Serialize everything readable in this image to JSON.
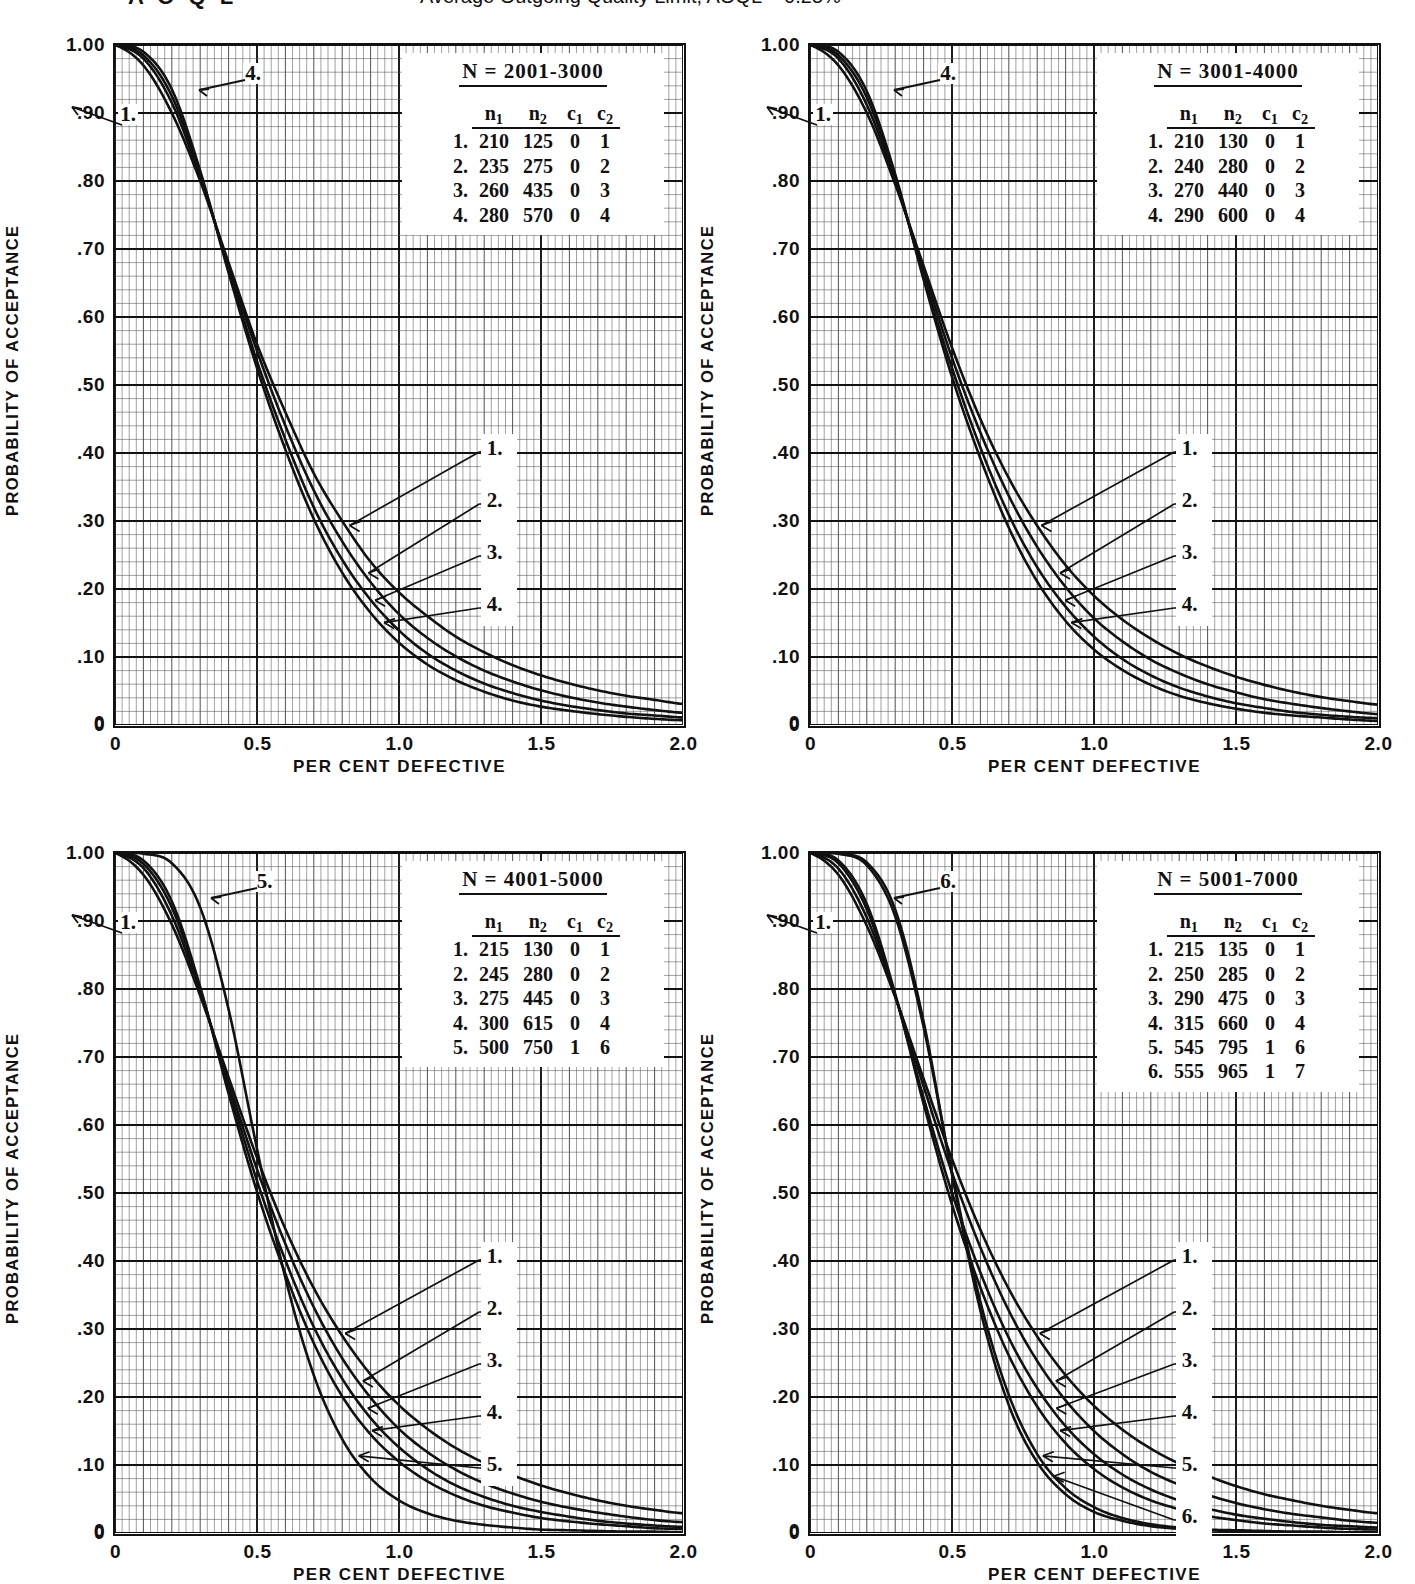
{
  "header": {
    "left_label": "A O Q L",
    "caption": "Average Outgoing Quality Limit, AOQL = 0.25%"
  },
  "axes": {
    "ylabel": "PROBABILITY OF ACCEPTANCE",
    "xlabel": "PER CENT DEFECTIVE",
    "yticks": [
      "1.00",
      ".90",
      ".80",
      ".70",
      ".60",
      ".50",
      ".40",
      ".30",
      ".20",
      ".10",
      "0"
    ],
    "xticks": [
      "0",
      "0.5",
      "1.0",
      "1.5",
      "2.0"
    ],
    "zero_corner": "0"
  },
  "legend_headers": {
    "n1": "n",
    "n1_sub": "1",
    "n2": "n",
    "n2_sub": "2",
    "c1": "c",
    "c1_sub": "1",
    "c2": "c",
    "c2_sub": "2"
  },
  "charts": [
    {
      "id": "chart-n-2001-3000",
      "legend_title": "N = 2001-3000",
      "rows": [
        {
          "idx": "1.",
          "n1": "210",
          "n2": "125",
          "c1": "0",
          "c2": "1"
        },
        {
          "idx": "2.",
          "n1": "235",
          "n2": "275",
          "c1": "0",
          "c2": "2"
        },
        {
          "idx": "3.",
          "n1": "260",
          "n2": "435",
          "c1": "0",
          "c2": "3"
        },
        {
          "idx": "4.",
          "n1": "280",
          "n2": "570",
          "c1": "0",
          "c2": "4"
        }
      ],
      "top_labels": [
        {
          "text": "4.",
          "x": 0.225,
          "y": 0.955
        },
        {
          "text": "1.",
          "x": 0.005,
          "y": 0.895
        }
      ],
      "right_labels": [
        "1.",
        "2.",
        "3.",
        "4."
      ]
    },
    {
      "id": "chart-n-3001-4000",
      "legend_title": "N = 3001-4000",
      "rows": [
        {
          "idx": "1.",
          "n1": "210",
          "n2": "130",
          "c1": "0",
          "c2": "1"
        },
        {
          "idx": "2.",
          "n1": "240",
          "n2": "280",
          "c1": "0",
          "c2": "2"
        },
        {
          "idx": "3.",
          "n1": "270",
          "n2": "440",
          "c1": "0",
          "c2": "3"
        },
        {
          "idx": "4.",
          "n1": "290",
          "n2": "600",
          "c1": "0",
          "c2": "4"
        }
      ],
      "top_labels": [
        {
          "text": "4.",
          "x": 0.225,
          "y": 0.955
        },
        {
          "text": "1.",
          "x": 0.005,
          "y": 0.895
        }
      ],
      "right_labels": [
        "1.",
        "2.",
        "3.",
        "4."
      ]
    },
    {
      "id": "chart-n-4001-5000",
      "legend_title": "N = 4001-5000",
      "rows": [
        {
          "idx": "1.",
          "n1": "215",
          "n2": "130",
          "c1": "0",
          "c2": "1"
        },
        {
          "idx": "2.",
          "n1": "245",
          "n2": "280",
          "c1": "0",
          "c2": "2"
        },
        {
          "idx": "3.",
          "n1": "275",
          "n2": "445",
          "c1": "0",
          "c2": "3"
        },
        {
          "idx": "4.",
          "n1": "300",
          "n2": "615",
          "c1": "0",
          "c2": "4"
        },
        {
          "idx": "5.",
          "n1": "500",
          "n2": "750",
          "c1": "1",
          "c2": "6"
        }
      ],
      "top_labels": [
        {
          "text": "5.",
          "x": 0.245,
          "y": 0.955
        },
        {
          "text": "1.",
          "x": 0.005,
          "y": 0.895
        }
      ],
      "right_labels": [
        "1.",
        "2.",
        "3.",
        "4.",
        "5."
      ]
    },
    {
      "id": "chart-n-5001-7000",
      "legend_title": "N = 5001-7000",
      "rows": [
        {
          "idx": "1.",
          "n1": "215",
          "n2": "135",
          "c1": "0",
          "c2": "1"
        },
        {
          "idx": "2.",
          "n1": "250",
          "n2": "285",
          "c1": "0",
          "c2": "2"
        },
        {
          "idx": "3.",
          "n1": "290",
          "n2": "475",
          "c1": "0",
          "c2": "3"
        },
        {
          "idx": "4.",
          "n1": "315",
          "n2": "660",
          "c1": "0",
          "c2": "4"
        },
        {
          "idx": "5.",
          "n1": "545",
          "n2": "795",
          "c1": "1",
          "c2": "6"
        },
        {
          "idx": "6.",
          "n1": "555",
          "n2": "965",
          "c1": "1",
          "c2": "7"
        }
      ],
      "top_labels": [
        {
          "text": "6.",
          "x": 0.225,
          "y": 0.955
        },
        {
          "text": "1.",
          "x": 0.005,
          "y": 0.895
        }
      ],
      "right_labels": [
        "1.",
        "2.",
        "3.",
        "4.",
        "5.",
        "6."
      ]
    }
  ],
  "chart_data": {
    "type": "line",
    "xlabel": "PER CENT DEFECTIVE",
    "ylabel": "PROBABILITY OF ACCEPTANCE",
    "xlim": [
      0,
      2.0
    ],
    "ylim": [
      0,
      1.0
    ],
    "xticks": [
      0,
      0.5,
      1.0,
      1.5,
      2.0
    ],
    "yticks": [
      0,
      0.1,
      0.2,
      0.3,
      0.4,
      0.5,
      0.6,
      0.7,
      0.8,
      0.9,
      1.0
    ],
    "grid": "major and minor rectangular grid",
    "legend_position": "upper-right inset box",
    "panels": [
      {
        "panel_title": "N = 2001-3000",
        "x": [
          0,
          0.1,
          0.2,
          0.3,
          0.4,
          0.5,
          0.6,
          0.7,
          0.8,
          0.9,
          1.0,
          1.1,
          1.2,
          1.3,
          1.4,
          1.5,
          1.6,
          1.7,
          1.8,
          1.9,
          2.0
        ],
        "series": [
          {
            "name": "1. n1=210 n2=125 c1=0 c2=1",
            "values": [
              1.0,
              0.97,
              0.9,
              0.8,
              0.68,
              0.56,
              0.46,
              0.37,
              0.3,
              0.24,
              0.195,
              0.16,
              0.13,
              0.107,
              0.088,
              0.073,
              0.061,
              0.051,
              0.043,
              0.037,
              0.031
            ]
          },
          {
            "name": "2. n1=235 n2=275 c1=0 c2=2",
            "values": [
              1.0,
              0.98,
              0.915,
              0.805,
              0.675,
              0.55,
              0.44,
              0.345,
              0.27,
              0.21,
              0.163,
              0.128,
              0.101,
              0.08,
              0.064,
              0.051,
              0.041,
              0.033,
              0.027,
              0.022,
              0.018
            ]
          },
          {
            "name": "3. n1=260 n2=435 c1=0 c2=3",
            "values": [
              1.0,
              0.985,
              0.925,
              0.81,
              0.67,
              0.535,
              0.42,
              0.32,
              0.243,
              0.184,
              0.139,
              0.105,
              0.08,
              0.061,
              0.047,
              0.036,
              0.028,
              0.022,
              0.017,
              0.014,
              0.011
            ]
          },
          {
            "name": "4. n1=280 n2=570 c1=0 c2=4",
            "values": [
              1.0,
              0.99,
              0.935,
              0.815,
              0.665,
              0.525,
              0.405,
              0.303,
              0.224,
              0.165,
              0.121,
              0.089,
              0.066,
              0.049,
              0.036,
              0.027,
              0.021,
              0.016,
              0.012,
              0.009,
              0.007
            ]
          }
        ]
      },
      {
        "panel_title": "N = 3001-4000",
        "x": [
          0,
          0.1,
          0.2,
          0.3,
          0.4,
          0.5,
          0.6,
          0.7,
          0.8,
          0.9,
          1.0,
          1.1,
          1.2,
          1.3,
          1.4,
          1.5,
          1.6,
          1.7,
          1.8,
          1.9,
          2.0
        ],
        "series": [
          {
            "name": "1. n1=210 n2=130 c1=0 c2=1",
            "values": [
              1.0,
              0.97,
              0.9,
              0.795,
              0.675,
              0.555,
              0.45,
              0.363,
              0.293,
              0.235,
              0.19,
              0.155,
              0.127,
              0.104,
              0.086,
              0.071,
              0.059,
              0.049,
              0.041,
              0.035,
              0.03
            ]
          },
          {
            "name": "2. n1=240 n2=280 c1=0 c2=2",
            "values": [
              1.0,
              0.98,
              0.912,
              0.8,
              0.668,
              0.54,
              0.43,
              0.337,
              0.262,
              0.203,
              0.157,
              0.123,
              0.096,
              0.076,
              0.06,
              0.048,
              0.038,
              0.031,
              0.025,
              0.02,
              0.016
            ]
          },
          {
            "name": "3. n1=270 n2=440 c1=0 c2=3",
            "values": [
              1.0,
              0.985,
              0.923,
              0.805,
              0.66,
              0.525,
              0.408,
              0.309,
              0.232,
              0.174,
              0.13,
              0.097,
              0.073,
              0.055,
              0.042,
              0.032,
              0.025,
              0.019,
              0.015,
              0.012,
              0.01
            ]
          },
          {
            "name": "4. n1=290 n2=600 c1=0 c2=4",
            "values": [
              1.0,
              0.99,
              0.932,
              0.81,
              0.655,
              0.512,
              0.392,
              0.29,
              0.211,
              0.153,
              0.111,
              0.081,
              0.059,
              0.043,
              0.032,
              0.024,
              0.018,
              0.014,
              0.011,
              0.008,
              0.006
            ]
          }
        ]
      },
      {
        "panel_title": "N = 4001-5000",
        "x": [
          0,
          0.1,
          0.2,
          0.3,
          0.4,
          0.5,
          0.6,
          0.7,
          0.8,
          0.9,
          1.0,
          1.1,
          1.2,
          1.3,
          1.4,
          1.5,
          1.6,
          1.7,
          1.8,
          1.9,
          2.0
        ],
        "series": [
          {
            "name": "1. n1=215 n2=130 c1=0 c2=1",
            "values": [
              1.0,
              0.968,
              0.895,
              0.79,
              0.67,
              0.552,
              0.447,
              0.36,
              0.29,
              0.233,
              0.188,
              0.153,
              0.125,
              0.103,
              0.085,
              0.07,
              0.058,
              0.048,
              0.04,
              0.034,
              0.029
            ]
          },
          {
            "name": "2. n1=245 n2=280 c1=0 c2=2",
            "values": [
              1.0,
              0.978,
              0.908,
              0.795,
              0.662,
              0.535,
              0.425,
              0.332,
              0.257,
              0.199,
              0.153,
              0.119,
              0.093,
              0.073,
              0.058,
              0.046,
              0.037,
              0.03,
              0.024,
              0.019,
              0.016
            ]
          },
          {
            "name": "3. n1=275 n2=445 c1=0 c2=3",
            "values": [
              1.0,
              0.984,
              0.92,
              0.8,
              0.655,
              0.518,
              0.401,
              0.303,
              0.227,
              0.169,
              0.126,
              0.094,
              0.07,
              0.053,
              0.04,
              0.031,
              0.024,
              0.018,
              0.014,
              0.011,
              0.009
            ]
          },
          {
            "name": "4. n1=300 n2=615 c1=0 c2=4",
            "values": [
              1.0,
              0.989,
              0.929,
              0.803,
              0.646,
              0.502,
              0.381,
              0.279,
              0.201,
              0.145,
              0.105,
              0.076,
              0.055,
              0.04,
              0.03,
              0.022,
              0.017,
              0.013,
              0.01,
              0.007,
              0.006
            ]
          },
          {
            "name": "5. n1=500 n2=750 c1=1 c2=6",
            "values": [
              1.0,
              0.999,
              0.985,
              0.92,
              0.77,
              0.565,
              0.375,
              0.232,
              0.138,
              0.081,
              0.048,
              0.029,
              0.018,
              0.012,
              0.008,
              0.005,
              0.004,
              0.003,
              0.002,
              0.002,
              0.001
            ]
          }
        ]
      },
      {
        "panel_title": "N = 5001-7000",
        "x": [
          0,
          0.1,
          0.2,
          0.3,
          0.4,
          0.5,
          0.6,
          0.7,
          0.8,
          0.9,
          1.0,
          1.1,
          1.2,
          1.3,
          1.4,
          1.5,
          1.6,
          1.7,
          1.8,
          1.9,
          2.0
        ],
        "series": [
          {
            "name": "1. n1=215 n2=135 c1=0 c2=1",
            "values": [
              1.0,
              0.968,
              0.893,
              0.788,
              0.668,
              0.55,
              0.446,
              0.359,
              0.289,
              0.232,
              0.187,
              0.152,
              0.124,
              0.102,
              0.084,
              0.069,
              0.057,
              0.048,
              0.04,
              0.034,
              0.029
            ]
          },
          {
            "name": "2. n1=250 n2=285 c1=0 c2=2",
            "values": [
              1.0,
              0.977,
              0.905,
              0.79,
              0.657,
              0.53,
              0.42,
              0.327,
              0.253,
              0.195,
              0.15,
              0.116,
              0.09,
              0.071,
              0.056,
              0.044,
              0.035,
              0.028,
              0.023,
              0.018,
              0.015
            ]
          },
          {
            "name": "3. n1=290 n2=475 c1=0 c2=3",
            "values": [
              1.0,
              0.985,
              0.917,
              0.79,
              0.64,
              0.5,
              0.383,
              0.287,
              0.213,
              0.157,
              0.116,
              0.086,
              0.064,
              0.048,
              0.036,
              0.027,
              0.021,
              0.016,
              0.012,
              0.01,
              0.008
            ]
          },
          {
            "name": "4. n1=315 n2=660 c1=0 c2=4",
            "values": [
              1.0,
              0.989,
              0.925,
              0.793,
              0.631,
              0.483,
              0.361,
              0.261,
              0.186,
              0.132,
              0.094,
              0.067,
              0.048,
              0.035,
              0.025,
              0.019,
              0.014,
              0.011,
              0.008,
              0.006,
              0.005
            ]
          },
          {
            "name": "5. n1=545 n2=795 c1=1 c2=6",
            "values": [
              1.0,
              0.999,
              0.982,
              0.907,
              0.744,
              0.53,
              0.34,
              0.203,
              0.116,
              0.066,
              0.038,
              0.022,
              0.013,
              0.008,
              0.005,
              0.004,
              0.003,
              0.002,
              0.002,
              0.001,
              0.001
            ]
          },
          {
            "name": "6. n1=555 n2=965 c1=1 c2=7",
            "values": [
              1.0,
              0.999,
              0.986,
              0.917,
              0.752,
              0.527,
              0.327,
              0.188,
              0.104,
              0.057,
              0.031,
              0.018,
              0.01,
              0.006,
              0.004,
              0.003,
              0.002,
              0.001,
              0.001,
              0.001,
              0.0
            ]
          }
        ]
      }
    ]
  }
}
